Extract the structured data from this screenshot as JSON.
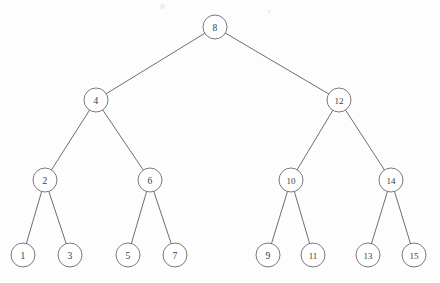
{
  "figure": {
    "type": "tree-diagram",
    "width": 440,
    "height": 283,
    "background_color": "#fdfdfd",
    "node_stroke_color": "#6a6a70",
    "node_fill_color": "#ffffff",
    "edge_stroke_color": "#5d5d63",
    "label_color": "#3a3a40",
    "node_radius": 12
  },
  "chart_data": {
    "type": "tree",
    "root": "8",
    "depth": 4,
    "node_count": 15,
    "nodes": [
      {
        "id": "n8",
        "label": "8",
        "x": 215,
        "y": 27,
        "level": 1,
        "radius": 12
      },
      {
        "id": "n4",
        "label": "4",
        "x": 96,
        "y": 100,
        "level": 2,
        "radius": 12
      },
      {
        "id": "n12",
        "label": "12",
        "x": 339,
        "y": 100,
        "level": 2,
        "radius": 12
      },
      {
        "id": "n2",
        "label": "2",
        "x": 45,
        "y": 180,
        "level": 3,
        "radius": 12
      },
      {
        "id": "n6",
        "label": "6",
        "x": 150,
        "y": 180,
        "level": 3,
        "radius": 12
      },
      {
        "id": "n10",
        "label": "10",
        "x": 291,
        "y": 180,
        "level": 3,
        "radius": 12
      },
      {
        "id": "n14",
        "label": "14",
        "x": 391,
        "y": 180,
        "level": 3,
        "radius": 12
      },
      {
        "id": "n1",
        "label": "1",
        "x": 23,
        "y": 255,
        "level": 4,
        "radius": 12
      },
      {
        "id": "n3",
        "label": "3",
        "x": 70,
        "y": 255,
        "level": 4,
        "radius": 12
      },
      {
        "id": "n5",
        "label": "5",
        "x": 128,
        "y": 255,
        "level": 4,
        "radius": 12
      },
      {
        "id": "n7",
        "label": "7",
        "x": 175,
        "y": 255,
        "level": 4,
        "radius": 12
      },
      {
        "id": "n9",
        "label": "9",
        "x": 268,
        "y": 255,
        "level": 4,
        "radius": 12
      },
      {
        "id": "n11",
        "label": "11",
        "x": 313,
        "y": 255,
        "level": 4,
        "radius": 12
      },
      {
        "id": "n13",
        "label": "13",
        "x": 368,
        "y": 255,
        "level": 4,
        "radius": 12
      },
      {
        "id": "n15",
        "label": "15",
        "x": 414,
        "y": 255,
        "level": 4,
        "radius": 12
      }
    ],
    "edges": [
      {
        "from": "n8",
        "to": "n4",
        "side": "left"
      },
      {
        "from": "n8",
        "to": "n12",
        "side": "right"
      },
      {
        "from": "n4",
        "to": "n2",
        "side": "left"
      },
      {
        "from": "n4",
        "to": "n6",
        "side": "right"
      },
      {
        "from": "n12",
        "to": "n10",
        "side": "left"
      },
      {
        "from": "n12",
        "to": "n14",
        "side": "right"
      },
      {
        "from": "n2",
        "to": "n1",
        "side": "left"
      },
      {
        "from": "n2",
        "to": "n3",
        "side": "right"
      },
      {
        "from": "n6",
        "to": "n5",
        "side": "left"
      },
      {
        "from": "n6",
        "to": "n7",
        "side": "right"
      },
      {
        "from": "n10",
        "to": "n9",
        "side": "left"
      },
      {
        "from": "n10",
        "to": "n11",
        "side": "right"
      },
      {
        "from": "n14",
        "to": "n13",
        "side": "left"
      },
      {
        "from": "n14",
        "to": "n15",
        "side": "right"
      }
    ],
    "inorder_traversal": [
      "1",
      "2",
      "3",
      "4",
      "5",
      "6",
      "7",
      "8",
      "9",
      "10",
      "11",
      "12",
      "13",
      "14",
      "15"
    ]
  },
  "specks": [
    {
      "x": 160,
      "y": 4,
      "size": 5
    },
    {
      "x": 268,
      "y": 10,
      "size": 3
    }
  ]
}
